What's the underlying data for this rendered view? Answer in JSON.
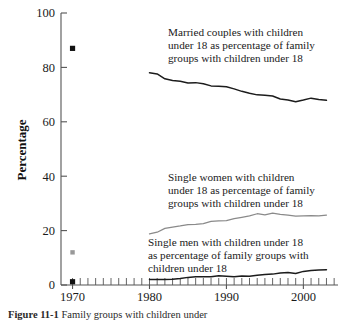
{
  "figure": {
    "caption_label": "Figure 11-1",
    "caption_text": "Family groups with children under"
  },
  "axes": {
    "y_title": "Percentage",
    "y_ticks": [
      "0",
      "20",
      "40",
      "60",
      "80",
      "100"
    ],
    "x_ticks": [
      "1970",
      "1980",
      "1990",
      "2000"
    ]
  },
  "annotations": {
    "married": {
      "line1": "Married couples with children",
      "line2": "under 18 as percentage of family",
      "line3": "groups with children under 18"
    },
    "single_women": {
      "line1": "Single women with children",
      "line2": "under 18 as percentage of family",
      "line3": "groups with children under 18"
    },
    "single_men": {
      "line1": "Single men with children under 18",
      "line2": "as percentage of family groups with",
      "line3": "children under 18"
    }
  },
  "colors": {
    "married_line": "#1c1c1c",
    "single_women_line": "#8a8a8a",
    "single_men_line": "#1c1c1c",
    "marker_married": "#111111",
    "marker_women": "#999999",
    "marker_men": "#111111",
    "axis": "#555555",
    "background": "#ffffff"
  },
  "chart_data": {
    "type": "line",
    "title": "",
    "xlabel": "",
    "ylabel": "Percentage",
    "xlim": [
      1968.5,
      2004.5
    ],
    "ylim": [
      0,
      100
    ],
    "grid": false,
    "legend": "annotations-inline",
    "x_tick_values": [
      1970,
      1980,
      1990,
      2000
    ],
    "y_tick_values": [
      0,
      20,
      40,
      60,
      80,
      100
    ],
    "minor_x_ticks": "annual",
    "series": [
      {
        "name": "Married couples with children under 18 as percentage of family groups with children under 18",
        "color": "#1c1c1c",
        "marker_points": [
          {
            "x": 1970,
            "y": 87
          }
        ],
        "x": [
          1980,
          1981,
          1982,
          1983,
          1984,
          1985,
          1986,
          1987,
          1988,
          1989,
          1990,
          1991,
          1992,
          1993,
          1994,
          1995,
          1996,
          1997,
          1998,
          1999,
          2000,
          2001,
          2002,
          2003
        ],
        "values": [
          78.0,
          77.6,
          75.8,
          75.2,
          74.9,
          74.3,
          74.4,
          74.0,
          73.2,
          73.1,
          72.9,
          72.1,
          71.2,
          70.5,
          69.9,
          69.8,
          69.5,
          68.4,
          68.0,
          67.4,
          68.0,
          68.7,
          68.2,
          67.9
        ]
      },
      {
        "name": "Single women with children under 18 as percentage of family groups with children under 18",
        "color": "#8a8a8a",
        "marker_points": [
          {
            "x": 1970,
            "y": 12
          }
        ],
        "x": [
          1980,
          1981,
          1982,
          1983,
          1984,
          1985,
          1986,
          1987,
          1988,
          1989,
          1990,
          1991,
          1992,
          1993,
          1994,
          1995,
          1996,
          1997,
          1998,
          1999,
          2000,
          2001,
          2002,
          2003
        ],
        "values": [
          18.8,
          19.4,
          20.8,
          21.3,
          21.7,
          22.2,
          22.3,
          22.6,
          23.4,
          23.6,
          23.7,
          24.4,
          24.9,
          25.4,
          26.2,
          25.8,
          26.4,
          26.0,
          25.7,
          25.3,
          25.4,
          25.5,
          25.4,
          25.7
        ]
      },
      {
        "name": "Single men with children under 18 as percentage of family groups with children under 18",
        "color": "#1c1c1c",
        "marker_points": [
          {
            "x": 1970,
            "y": 1.2
          }
        ],
        "x": [
          1980,
          1981,
          1982,
          1983,
          1984,
          1985,
          1986,
          1987,
          1988,
          1989,
          1990,
          1991,
          1992,
          1993,
          1994,
          1995,
          1996,
          1997,
          1998,
          1999,
          2000,
          2001,
          2002,
          2003
        ],
        "values": [
          2.0,
          2.0,
          2.0,
          2.1,
          2.4,
          2.8,
          3.0,
          3.0,
          3.0,
          3.4,
          3.2,
          3.0,
          3.3,
          3.2,
          3.6,
          3.9,
          4.0,
          4.4,
          4.6,
          4.2,
          5.0,
          5.3,
          5.5,
          5.6
        ]
      }
    ]
  }
}
